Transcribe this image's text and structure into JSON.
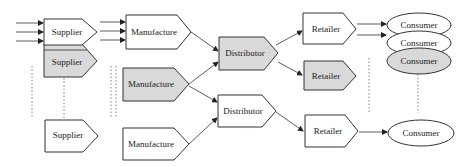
{
  "diagram": {
    "colors": {
      "highlight_fill": "#d9d9d9",
      "default_fill": "#ffffff",
      "stroke": "#333333"
    },
    "nodes": {
      "supplier_1": {
        "label": "Supplier",
        "highlighted": false
      },
      "supplier_2": {
        "label": "Supplier",
        "highlighted": true
      },
      "supplier_3": {
        "label": "Supplier",
        "highlighted": false
      },
      "manufacture_1": {
        "label": "Manufacture",
        "highlighted": false
      },
      "manufacture_2": {
        "label": "Manufacture",
        "highlighted": true
      },
      "manufacture_3": {
        "label": "Manufacture",
        "highlighted": false
      },
      "distributor_1": {
        "label": "Distributor",
        "highlighted": true
      },
      "distributor_2": {
        "label": "Distributor",
        "highlighted": false
      },
      "retailer_1": {
        "label": "Retailer",
        "highlighted": false
      },
      "retailer_2": {
        "label": "Retailer",
        "highlighted": true
      },
      "retailer_3": {
        "label": "Retailer",
        "highlighted": false
      },
      "consumer_1": {
        "label": "Consumer",
        "highlighted": false
      },
      "consumer_2": {
        "label": "Consumer",
        "highlighted": false
      },
      "consumer_3": {
        "label": "Consumer",
        "highlighted": true
      },
      "consumer_4": {
        "label": "Consumer",
        "highlighted": false
      }
    },
    "edges": [
      {
        "from": "input",
        "to": "supplier_1"
      },
      {
        "from": "input",
        "to": "supplier_1"
      },
      {
        "from": "input",
        "to": "supplier_1"
      },
      {
        "from": "input",
        "to": "manufacture_1"
      },
      {
        "from": "input",
        "to": "manufacture_1"
      },
      {
        "from": "input",
        "to": "manufacture_1"
      },
      {
        "from": "manufacture_1",
        "to": "distributor_1"
      },
      {
        "from": "manufacture_2",
        "to": "distributor_1"
      },
      {
        "from": "manufacture_2",
        "to": "distributor_2"
      },
      {
        "from": "manufacture_3",
        "to": "distributor_2"
      },
      {
        "from": "distributor_1",
        "to": "retailer_1"
      },
      {
        "from": "distributor_1",
        "to": "retailer_2"
      },
      {
        "from": "distributor_2",
        "to": "retailer_3"
      },
      {
        "from": "retailer_1",
        "to": "consumer_1"
      },
      {
        "from": "retailer_1",
        "to": "consumer_2"
      },
      {
        "from": "retailer_3",
        "to": "consumer_4"
      }
    ]
  }
}
